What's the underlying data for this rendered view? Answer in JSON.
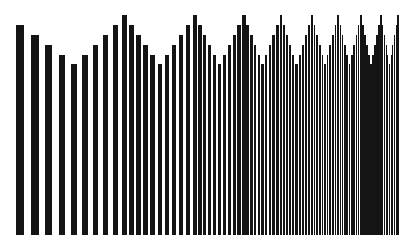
{
  "chart_data": {
    "type": "bar",
    "title": "",
    "xlabel": "",
    "ylabel": "",
    "grid": false,
    "legend": null,
    "baseline_y": 235,
    "bar_color": "#141414",
    "background": "#ffffff",
    "first_segment": {
      "centers": [
        20,
        35,
        48.5,
        62,
        74,
        85,
        95.5,
        105.5,
        115.5,
        124.5
      ],
      "widths": [
        8,
        8,
        7,
        6,
        6,
        6,
        5,
        5,
        5,
        5
      ],
      "heights": [
        210,
        200,
        190,
        180,
        171,
        180,
        190,
        200,
        210,
        220
      ]
    },
    "cycles": {
      "peaks": [
        124.5,
        195,
        244,
        281,
        312,
        338,
        361,
        381,
        398
      ],
      "widths": [
        4.5,
        3.3,
        2.6,
        2.1,
        1.8,
        1.6,
        1.4,
        1.2
      ],
      "heights": [
        210,
        200,
        190,
        180,
        171,
        180,
        190,
        200,
        210,
        220
      ]
    }
  }
}
